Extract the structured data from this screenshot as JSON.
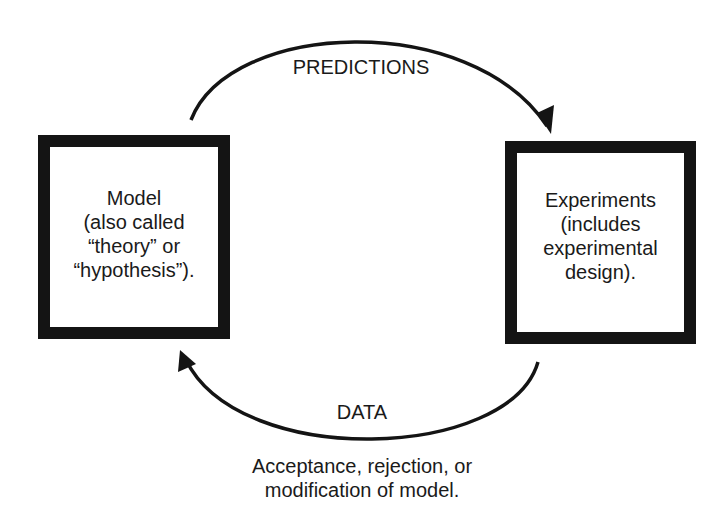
{
  "diagram": {
    "type": "cycle",
    "nodes": [
      {
        "id": "model",
        "lines": [
          "Model",
          "(also called",
          "“theory” or",
          "“hypothesis”)."
        ]
      },
      {
        "id": "experiments",
        "lines": [
          "Experiments",
          "(includes",
          "experimental",
          "design)."
        ]
      }
    ],
    "edges": [
      {
        "from": "model",
        "to": "experiments",
        "label": "PREDICTIONS"
      },
      {
        "from": "experiments",
        "to": "model",
        "label": "DATA"
      }
    ],
    "caption": {
      "lines": [
        "Acceptance, rejection, or",
        "modification of model."
      ]
    },
    "colors": {
      "stroke": "#141414",
      "background": "#ffffff",
      "text": "#1a1a1a"
    }
  }
}
